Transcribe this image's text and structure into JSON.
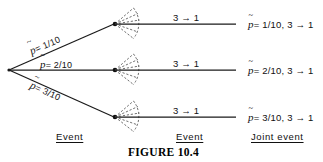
{
  "figure": {
    "caption": "FIGURE 10.4",
    "symbol": "p",
    "arrow": "→"
  },
  "columns": [
    {
      "key": "event-left",
      "label": "Event"
    },
    {
      "key": "event-middle",
      "label": "Event"
    },
    {
      "key": "joint-event",
      "label": "Joint event"
    }
  ],
  "branches": [
    {
      "id": "branch-1",
      "probability_label": "= 1/10",
      "probability_value": "1/10",
      "transition_label": "3 → 1",
      "joint_label": "= 1/10,  3 → 1"
    },
    {
      "id": "branch-2",
      "probability_label": "= 2/10",
      "probability_value": "2/10",
      "transition_label": "3 → 1",
      "joint_label": "= 2/10,  3 → 1"
    },
    {
      "id": "branch-3",
      "probability_label": "= 3/10",
      "probability_value": "3/10",
      "transition_label": "3 → 1",
      "joint_label": "= 3/10,  3 → 1"
    }
  ],
  "colors": {
    "line": "#1a1a1a",
    "fan": "#4a4a4a",
    "text": "#111111",
    "background": "#ffffff"
  }
}
